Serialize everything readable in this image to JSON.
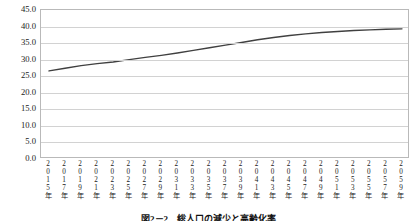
{
  "caption": "図2－2　総人口の減少と高齢化率",
  "colors": {
    "line": "#404040",
    "grid": "#d2d2d2",
    "frame": "#b9b9b9",
    "text": "#1a1a1a",
    "background": "#ffffff"
  },
  "chart_data": {
    "type": "line",
    "title": "",
    "xlabel": "",
    "ylabel": "",
    "ylim": [
      0.0,
      45.0
    ],
    "ytick_labels": [
      "45.0",
      "40.0",
      "35.0",
      "30.0",
      "25.0",
      "20.0",
      "15.0",
      "10.0",
      "5.0",
      "0.0"
    ],
    "yticks": [
      45.0,
      40.0,
      35.0,
      30.0,
      25.0,
      20.0,
      15.0,
      10.0,
      5.0,
      0.0
    ],
    "grid": true,
    "legend": "none",
    "categories": [
      "2015年",
      "2017年",
      "2019年",
      "2021年",
      "2023年",
      "2025年",
      "2027年",
      "2029年",
      "2031年",
      "2033年",
      "2035年",
      "2037年",
      "2039年",
      "2041年",
      "2043年",
      "2045年",
      "2047年",
      "2049年",
      "2051年",
      "2053年",
      "2055年",
      "2057年",
      "2059年"
    ],
    "series": [
      {
        "name": "高齢化率",
        "values": [
          26.6,
          27.4,
          28.2,
          28.8,
          29.3,
          30.0,
          30.7,
          31.3,
          32.0,
          32.8,
          33.6,
          34.4,
          35.2,
          36.0,
          36.7,
          37.3,
          37.8,
          38.2,
          38.5,
          38.8,
          39.0,
          39.2,
          39.3
        ]
      }
    ]
  }
}
